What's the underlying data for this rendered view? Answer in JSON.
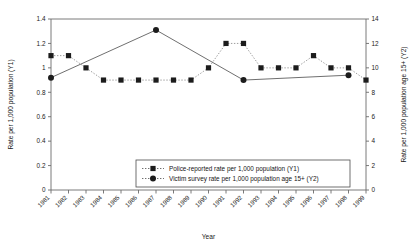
{
  "chart_data": {
    "type": "line",
    "title": "",
    "xlabel": "Year",
    "ylabel": "Rate per 1,000 population (Y1)",
    "y2label": "Rate per 1,000 population age 15+ (Y2)",
    "grid": false,
    "legend_position": "bottom-center",
    "categories": [
      "1981",
      "1982",
      "1983",
      "1984",
      "1985",
      "1986",
      "1987",
      "1988",
      "1989",
      "1990",
      "1991",
      "1992",
      "1993",
      "1994",
      "1995",
      "1996",
      "1997",
      "1998",
      "1999"
    ],
    "ylim": [
      0,
      1.4
    ],
    "yticks": [
      "0",
      "0.2",
      "0.4",
      "0.6",
      "0.8",
      "1",
      "1.2",
      "1.4"
    ],
    "ytick_values": [
      0,
      0.2,
      0.4,
      0.6,
      0.8,
      1.0,
      1.2,
      1.4
    ],
    "y2lim": [
      0,
      14
    ],
    "y2ticks": [
      "0",
      "2",
      "4",
      "6",
      "8",
      "10",
      "12",
      "14"
    ],
    "y2tick_values": [
      0,
      2,
      4,
      6,
      8,
      10,
      12,
      14
    ],
    "series": [
      {
        "name": "Police-reported rate per 1,000 population (Y1)",
        "axis": "Y1",
        "marker": "square",
        "line_style": "dotted",
        "values": [
          1.1,
          1.1,
          1.0,
          0.9,
          0.9,
          0.9,
          0.9,
          0.9,
          0.9,
          1.0,
          1.2,
          1.2,
          1.0,
          1.0,
          1.0,
          1.1,
          1.0,
          1.0,
          0.9
        ]
      },
      {
        "name": "Victim survey rate per 1,000 population age 15+ (Y2)",
        "axis": "Y2",
        "marker": "circle",
        "line_style": "solid",
        "values": [
          9.2,
          null,
          null,
          null,
          null,
          null,
          13.1,
          null,
          null,
          null,
          null,
          9.0,
          null,
          null,
          null,
          null,
          null,
          9.4,
          null
        ]
      }
    ]
  },
  "legend": {
    "items": [
      {
        "label": "Police-reported rate per 1,000 population (Y1)",
        "marker": "square"
      },
      {
        "label": "Victim survey rate per 1,000 population age 15+ (Y2)",
        "marker": "circle"
      }
    ]
  },
  "colors": {
    "marker": "#1c1c1c",
    "axis": "#6b6b6b",
    "solid_line": "#555555",
    "dotted_line": "#8a8a8a",
    "background": "#ffffff"
  }
}
